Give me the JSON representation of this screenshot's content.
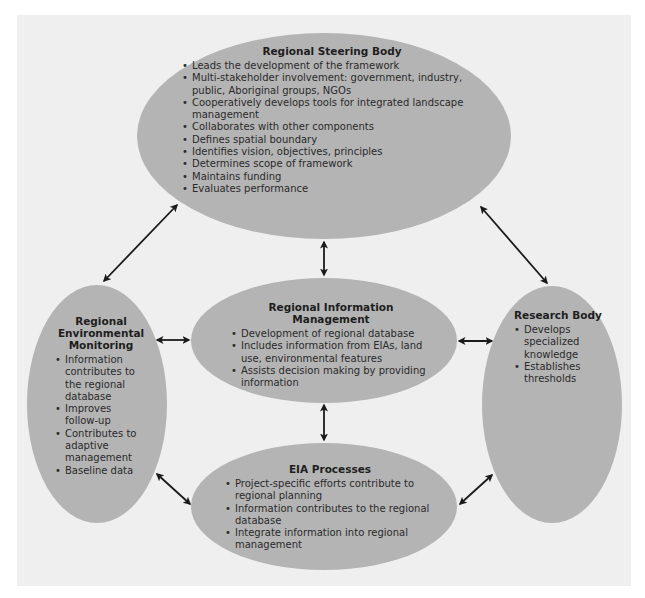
{
  "diagram": {
    "steering": {
      "title": "Regional Steering Body",
      "items": [
        "Leads the development of the framework",
        "Multi-stakeholder involvement: government, industry, public, Aboriginal groups, NGOs",
        "Cooperatively develops tools for integrated landscape management",
        "Collaborates with other components",
        "Defines spatial boundary",
        "Identifies vision, objectives, principles",
        "Determines scope of framework",
        "Maintains funding",
        "Evaluates performance"
      ]
    },
    "information": {
      "title": "Regional Information Management",
      "items": [
        "Development of regional database",
        "Includes information from EIAs, land use, environmental features",
        "Assists decision making by providing information"
      ]
    },
    "monitoring": {
      "title": "Regional Environmental Monitoring",
      "items": [
        "Information contributes to the regional database",
        "Improves follow-up",
        "Contributes to adaptive management",
        "Baseline data"
      ]
    },
    "research": {
      "title": "Research Body",
      "items": [
        "Develops specialized knowledge",
        "Establishes thresholds"
      ]
    },
    "eia": {
      "title": "EIA Processes",
      "items": [
        "Project-specific efforts contribute to regional planning",
        "Information contributes to the regional database",
        "Integrate information into regional management"
      ]
    },
    "connections": [
      {
        "from": "Regional Steering Body",
        "to": "Regional Environmental Monitoring",
        "type": "bidirectional"
      },
      {
        "from": "Regional Steering Body",
        "to": "Research Body",
        "type": "bidirectional"
      },
      {
        "from": "Regional Steering Body",
        "to": "Regional Information Management",
        "type": "bidirectional"
      },
      {
        "from": "Regional Environmental Monitoring",
        "to": "Regional Information Management",
        "type": "bidirectional"
      },
      {
        "from": "Regional Information Management",
        "to": "Research Body",
        "type": "bidirectional"
      },
      {
        "from": "Regional Information Management",
        "to": "EIA Processes",
        "type": "bidirectional"
      },
      {
        "from": "Regional Environmental Monitoring",
        "to": "EIA Processes",
        "type": "bidirectional"
      },
      {
        "from": "Research Body",
        "to": "EIA Processes",
        "type": "bidirectional"
      }
    ],
    "colors": {
      "panel": "#efefef",
      "ellipse": "#b4b4b4",
      "arrow": "#1a1a1a"
    }
  }
}
